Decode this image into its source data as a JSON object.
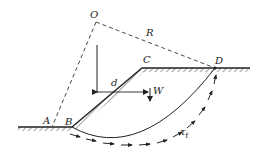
{
  "diagram": {
    "type": "slope-stability-circular-slip",
    "colors": {
      "line": "#222222",
      "hatch": "#444444",
      "background": "#ffffff"
    },
    "points": {
      "O": {
        "label": "O"
      },
      "A": {
        "label": "A"
      },
      "B": {
        "label": "B"
      },
      "C": {
        "label": "C"
      },
      "D": {
        "label": "D"
      }
    },
    "labels": {
      "radius": "R",
      "moment_arm": "d",
      "weight": "W",
      "shear_strength": "τ",
      "shear_strength_sub": "f"
    }
  }
}
